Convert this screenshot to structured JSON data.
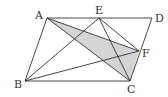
{
  "diagram": {
    "type": "geometry-parallelogram",
    "points": {
      "A": {
        "x": 47,
        "y": 18,
        "label": "A",
        "lx": 35,
        "ly": 19
      },
      "E": {
        "x": 99,
        "y": 18,
        "label": "E",
        "lx": 95,
        "ly": 14
      },
      "D": {
        "x": 152,
        "y": 18,
        "label": "D",
        "lx": 155,
        "ly": 22
      },
      "B": {
        "x": 25,
        "y": 81,
        "label": "B",
        "lx": 14,
        "ly": 88
      },
      "C": {
        "x": 130,
        "y": 81,
        "label": "C",
        "lx": 127,
        "ly": 93
      },
      "F": {
        "x": 139,
        "y": 51,
        "label": "F",
        "lx": 142,
        "ly": 57
      }
    },
    "segments": [
      "AD",
      "BC",
      "AB",
      "DC",
      "AC",
      "AF",
      "EB",
      "EC",
      "EF",
      "BF"
    ],
    "shaded": [
      "A",
      "F",
      "C"
    ],
    "shade_color": "#d4d4d4"
  }
}
